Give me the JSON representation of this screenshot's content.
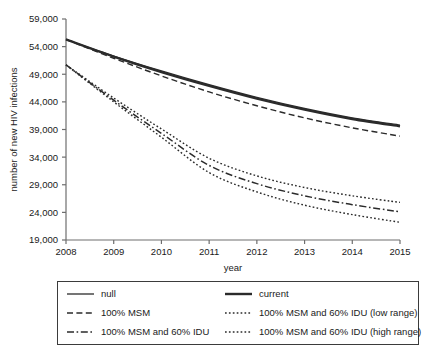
{
  "chart_data": {
    "type": "line",
    "title": "",
    "xlabel": "year",
    "ylabel": "number of new HIV infections",
    "x": [
      2008,
      2009,
      2010,
      2011,
      2012,
      2013,
      2014,
      2015
    ],
    "xlim": [
      2008,
      2015
    ],
    "ylim": [
      19000,
      59000
    ],
    "x_tick_labels": [
      "2008",
      "2009",
      "2010",
      "2011",
      "2012",
      "2013",
      "2014",
      "2015"
    ],
    "y_tick_labels": [
      "19,000",
      "24,000",
      "29,000",
      "34,000",
      "39,000",
      "44,000",
      "49,000",
      "54,000",
      "59,000"
    ],
    "y_ticks": [
      19000,
      24000,
      29000,
      34000,
      39000,
      44000,
      49000,
      54000,
      59000
    ],
    "grid": false,
    "legend_position": "below",
    "series": [
      {
        "name": "null",
        "style": "solid-thin",
        "values": [
          55300,
          52300,
          49600,
          47100,
          44800,
          42800,
          41100,
          39800
        ]
      },
      {
        "name": "current",
        "style": "solid-thick",
        "values": [
          55300,
          52200,
          49400,
          46900,
          44600,
          42600,
          40900,
          39600
        ]
      },
      {
        "name": "100% MSM",
        "style": "dashed",
        "values": [
          55300,
          51900,
          48700,
          45800,
          43300,
          41100,
          39300,
          37800
        ]
      },
      {
        "name": "100% MSM and 60% IDU",
        "style": "dash-dot",
        "values": [
          50700,
          44300,
          38300,
          32500,
          29200,
          27000,
          25400,
          24100
        ]
      },
      {
        "name": "100% MSM and 60% IDU (low range)",
        "style": "dotted",
        "values": [
          50700,
          44000,
          37600,
          31200,
          27700,
          25300,
          23600,
          22200
        ]
      },
      {
        "name": "100% MSM and 60% IDU (high range)",
        "style": "dotted",
        "values": [
          50700,
          44700,
          39100,
          33800,
          30600,
          28500,
          27000,
          25800
        ]
      }
    ]
  },
  "legend": {
    "items": [
      {
        "label": "null",
        "style": "solid-thin"
      },
      {
        "label": "current",
        "style": "solid-thick"
      },
      {
        "label": "100% MSM",
        "style": "dashed"
      },
      {
        "label": "100% MSM and 60% IDU (low range)",
        "style": "dotted"
      },
      {
        "label": "100% MSM and 60% IDU",
        "style": "dash-dot"
      },
      {
        "label": "100% MSM and 60% IDU (high range)",
        "style": "dotted"
      }
    ]
  },
  "colors": {
    "line": "#2b2b2b",
    "axis": "#6e6e6e",
    "text": "#1a1a1a",
    "background": "#ffffff"
  }
}
